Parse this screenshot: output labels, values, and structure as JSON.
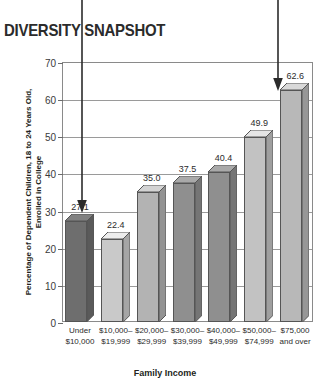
{
  "title": "DIVERSITY SNAPSHOT",
  "chart_data": {
    "type": "bar",
    "title": "DIVERSITY SNAPSHOT",
    "xlabel": "Family Income",
    "ylabel": "Percentage of Dependent Children, 18 to 24 Years Old, Enrolled in College",
    "ylabel_line1": "Percentage of Dependent Children, 18 to 24 Years Old,",
    "ylabel_line2": "Enrolled in College",
    "categories": [
      "Under\n$10,000",
      "$10,000–\n$19,999",
      "$20,000–\n$29,999",
      "$30,000–\n$39,999",
      "$40,000–\n$49,999",
      "$50,000–\n$74,999",
      "$75,000\nand over"
    ],
    "category_lines": [
      [
        "Under",
        "$10,000"
      ],
      [
        "$10,000–",
        "$19,999"
      ],
      [
        "$20,000–",
        "$29,999"
      ],
      [
        "$30,000–",
        "$39,999"
      ],
      [
        "$40,000–",
        "$49,999"
      ],
      [
        "$50,000–",
        "$74,999"
      ],
      [
        "$75,000",
        "and over"
      ]
    ],
    "values": [
      27.1,
      22.4,
      35.0,
      37.5,
      40.4,
      49.9,
      62.6
    ],
    "value_labels": [
      "27.1",
      "22.4",
      "35.0",
      "37.5",
      "40.4",
      "49.9",
      "62.6"
    ],
    "bar_colors": [
      "#6e6e6e",
      "#c9c9c9",
      "#b3b3b3",
      "#8f8f8f",
      "#8f8f8f",
      "#c2c2c2",
      "#b8b8b8"
    ],
    "ylim": [
      0,
      70
    ],
    "yticks": [
      0,
      10,
      20,
      30,
      40,
      50,
      60,
      70
    ],
    "ytick_labels": [
      "0",
      "10",
      "20",
      "30",
      "40",
      "50",
      "60",
      "70"
    ],
    "grid": true,
    "legend": "none",
    "annotations": [
      {
        "name": "arrow-to-lowest-bar",
        "target_category": "Under $10,000",
        "target_value": 27.1
      },
      {
        "name": "arrow-to-highest-bar",
        "target_category": "$75,000 and over",
        "target_value": 62.6
      }
    ]
  }
}
